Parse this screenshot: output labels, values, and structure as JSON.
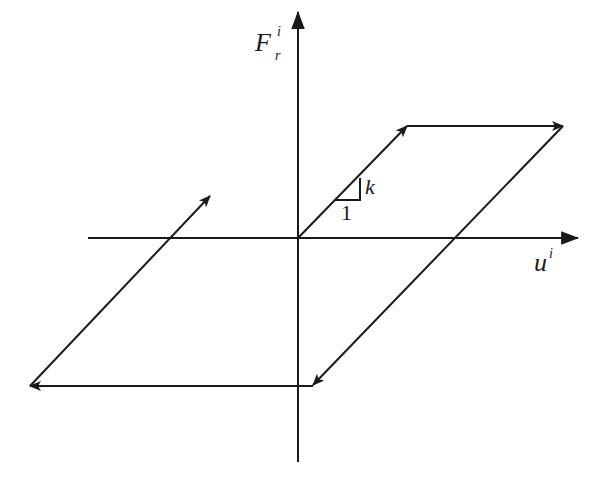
{
  "diagram": {
    "type": "hysteresis-loop",
    "stroke_color": "#1a1a1a",
    "background": "#ffffff",
    "axes": {
      "vertical_label": {
        "main": "F",
        "subscript": "r",
        "superscript": "i"
      },
      "horizontal_label": {
        "main": "u",
        "superscript": "i"
      }
    },
    "slope_indicator": {
      "run_label": "1",
      "rise_label": "k"
    },
    "geometry": {
      "origin": [
        298,
        238
      ],
      "v_axis": {
        "x": 298,
        "top": 12,
        "bottom": 462
      },
      "h_axis": {
        "y": 238,
        "left": 88,
        "right": 578
      },
      "loop_path": [
        [
          298,
          238
        ],
        [
          407,
          126
        ],
        [
          563,
          126
        ],
        [
          313,
          386
        ],
        [
          30,
          386
        ],
        [
          210,
          196
        ]
      ]
    }
  }
}
